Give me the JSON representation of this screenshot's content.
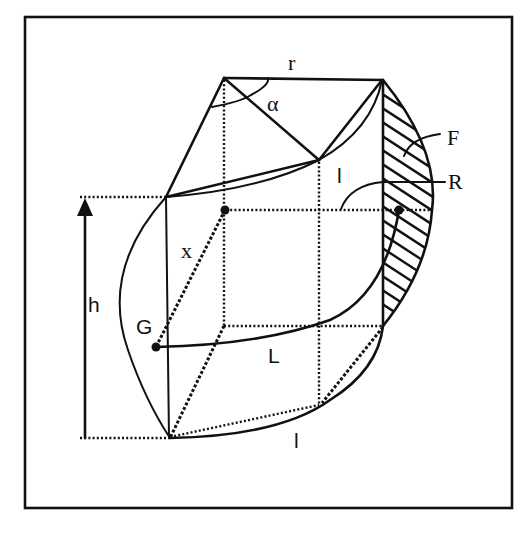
{
  "figure": {
    "type": "geometric-diagram",
    "colors": {
      "line": "#111111",
      "background": "#ffffff"
    }
  },
  "labels": {
    "r": "r",
    "alpha": "α",
    "F": "F",
    "R": "R",
    "l_upper": "l",
    "l_lower": "l",
    "x": "x",
    "h": "h",
    "G": "G",
    "L": "L"
  }
}
